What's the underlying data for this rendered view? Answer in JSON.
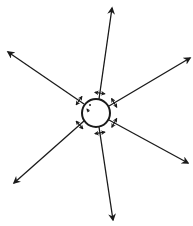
{
  "diagram": {
    "title": "",
    "center": {
      "label": "",
      "shape": "circle",
      "inner_marks": [
        "dot",
        "small-arrow"
      ]
    },
    "rays": [
      {
        "id": "top",
        "direction": "up",
        "double_arrow_near_circle": true
      },
      {
        "id": "upper-right",
        "direction": "upper-right",
        "double_arrow_near_circle": true
      },
      {
        "id": "lower-right",
        "direction": "lower-right",
        "double_arrow_near_circle": true
      },
      {
        "id": "bottom",
        "direction": "down",
        "double_arrow_near_circle": true
      },
      {
        "id": "lower-left",
        "direction": "lower-left",
        "double_arrow_near_circle": true
      },
      {
        "id": "upper-left",
        "direction": "upper-left",
        "double_arrow_near_circle": true
      }
    ],
    "colors": {
      "stroke": "#1a1a1a",
      "background": "#ffffff"
    }
  }
}
